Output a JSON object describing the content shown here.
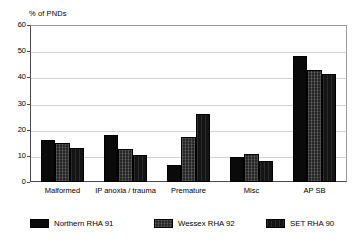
{
  "chart_data": {
    "type": "bar",
    "title": "% of PNDs",
    "xlabel": "",
    "ylabel": "% of PNDs",
    "ylim": [
      0,
      60
    ],
    "yticks": [
      0,
      10,
      20,
      30,
      40,
      50,
      60
    ],
    "grid": true,
    "legend_position": "bottom",
    "categories": [
      "Malformed",
      "IP anoxia / trauma",
      "Premature",
      "Misc",
      "AP SB"
    ],
    "series": [
      {
        "name": "Northern RHA 91",
        "values": [
          16.2,
          18.0,
          6.6,
          9.8,
          48.5
        ]
      },
      {
        "name": "Wessex RHA 92",
        "values": [
          15.0,
          12.7,
          17.4,
          10.8,
          43.0
        ]
      },
      {
        "name": "SET RHA 90",
        "values": [
          13.0,
          10.3,
          26.0,
          8.1,
          41.4
        ]
      }
    ]
  },
  "axis": {
    "title": "% of PNDs",
    "tick_labels": [
      "60",
      "50",
      "40",
      "30",
      "20",
      "10",
      "0"
    ]
  },
  "categories": [
    {
      "label": "Malformed"
    },
    {
      "label": "IP anoxia / trauma"
    },
    {
      "label": "Premature"
    },
    {
      "label": "Misc"
    },
    {
      "label": "AP SB"
    }
  ],
  "legend": [
    {
      "label": "Northern RHA 91",
      "color": "#0a0a0a"
    },
    {
      "label": "Wessex RHA 92",
      "color": "#262626"
    },
    {
      "label": "SET RHA 90",
      "color": "#141414"
    }
  ]
}
